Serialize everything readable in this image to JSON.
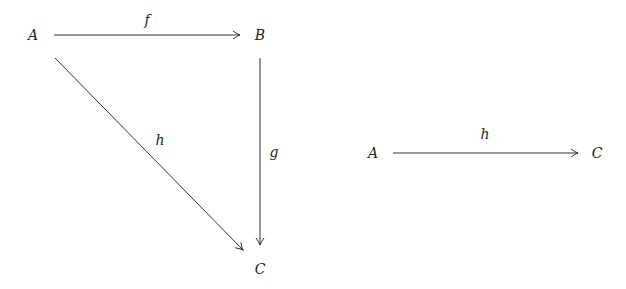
{
  "diagrams": {
    "triangle": {
      "nodes": {
        "A": {
          "label": "A",
          "x": 33,
          "y": 35
        },
        "B": {
          "label": "B",
          "x": 260,
          "y": 35
        },
        "C": {
          "label": "C",
          "x": 260,
          "y": 269
        }
      },
      "arrows": {
        "f": {
          "label": "f",
          "from": "A",
          "to": "B",
          "label_x": 147,
          "label_y": 20
        },
        "g": {
          "label": "g",
          "from": "B",
          "to": "C",
          "label_x": 274,
          "label_y": 152
        },
        "h": {
          "label": "h",
          "from": "A",
          "to": "C",
          "label_x": 160,
          "label_y": 140
        }
      }
    },
    "composite": {
      "nodes": {
        "A": {
          "label": "A",
          "x": 373,
          "y": 153
        },
        "C": {
          "label": "C",
          "x": 597,
          "y": 153
        }
      },
      "arrows": {
        "h": {
          "label": "h",
          "from": "A",
          "to": "C",
          "label_x": 485,
          "label_y": 134
        }
      }
    }
  },
  "colors": {
    "stroke": "#333333",
    "text": "#222222",
    "background": "#ffffff"
  }
}
